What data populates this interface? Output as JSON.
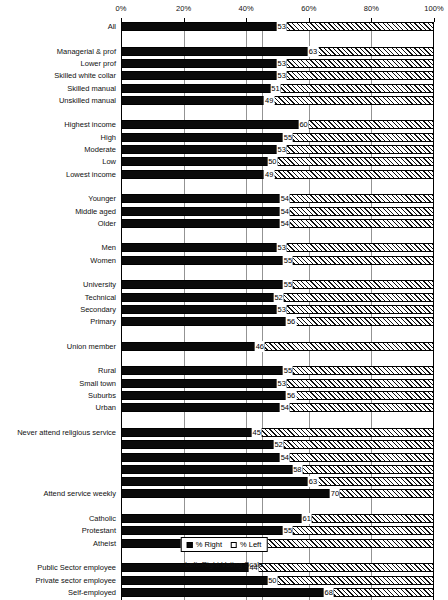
{
  "chart_data": {
    "type": "bar",
    "orientation": "horizontal",
    "title": "",
    "xlabel": "Left–Right Voting Scale",
    "ylabel": "",
    "xlim": [
      0,
      100
    ],
    "xticks": [
      0,
      20,
      40,
      60,
      80,
      100
    ],
    "xticklabels": [
      "0%",
      "20%",
      "40%",
      "60%",
      "80%",
      "100%"
    ],
    "gridlines": [
      20,
      40,
      45,
      60,
      80
    ],
    "grid": true,
    "legend_position": "bottom",
    "series": [
      {
        "name": "% Right",
        "key": "right",
        "color": "#0a0a0a",
        "style": "solid"
      },
      {
        "name": "% Left",
        "key": "left",
        "color": "#ffffff",
        "style": "hatched"
      }
    ],
    "stacked": true,
    "value_suffix": "",
    "groups": [
      {
        "name": "overall",
        "rows": [
          {
            "label": "All",
            "value": 53,
            "show_label": true,
            "show_value": true
          }
        ]
      },
      {
        "name": "occupation",
        "rows": [
          {
            "label": "Managerial & prof",
            "value": 63,
            "show_label": true,
            "show_value": true
          },
          {
            "label": "Lower prof",
            "value": 53,
            "show_label": true,
            "show_value": true
          },
          {
            "label": "Skilled white collar",
            "value": 53,
            "show_label": true,
            "show_value": true
          },
          {
            "label": "Skilled manual",
            "value": 51,
            "show_label": true,
            "show_value": true
          },
          {
            "label": "Unskilled manual",
            "value": 49,
            "show_label": true,
            "show_value": true
          }
        ]
      },
      {
        "name": "income",
        "rows": [
          {
            "label": "Highest income",
            "value": 60,
            "show_label": true,
            "show_value": true
          },
          {
            "label": "High",
            "value": 55,
            "show_label": true,
            "show_value": true
          },
          {
            "label": "Moderate",
            "value": 53,
            "show_label": true,
            "show_value": true
          },
          {
            "label": "Low",
            "value": 50,
            "show_label": true,
            "show_value": true
          },
          {
            "label": "Lowest income",
            "value": 49,
            "show_label": true,
            "show_value": true
          }
        ]
      },
      {
        "name": "age",
        "rows": [
          {
            "label": "Younger",
            "value": 54,
            "show_label": true,
            "show_value": true
          },
          {
            "label": "Middle aged",
            "value": 54,
            "show_label": true,
            "show_value": true
          },
          {
            "label": "Older",
            "value": 54,
            "show_label": true,
            "show_value": true
          }
        ]
      },
      {
        "name": "gender",
        "rows": [
          {
            "label": "Men",
            "value": 53,
            "show_label": true,
            "show_value": true
          },
          {
            "label": "Women",
            "value": 55,
            "show_label": true,
            "show_value": true
          }
        ]
      },
      {
        "name": "education",
        "rows": [
          {
            "label": "University",
            "value": 55,
            "show_label": true,
            "show_value": true
          },
          {
            "label": "Technical",
            "value": 52,
            "show_label": true,
            "show_value": true
          },
          {
            "label": "Secondary",
            "value": 53,
            "show_label": true,
            "show_value": true
          },
          {
            "label": "Primary",
            "value": 56,
            "show_label": true,
            "show_value": true
          }
        ]
      },
      {
        "name": "union",
        "rows": [
          {
            "label": "Union member",
            "value": 46,
            "show_label": true,
            "show_value": true
          }
        ]
      },
      {
        "name": "settlement",
        "rows": [
          {
            "label": "Rural",
            "value": 55,
            "show_label": true,
            "show_value": true
          },
          {
            "label": "Small town",
            "value": 53,
            "show_label": true,
            "show_value": true
          },
          {
            "label": "Suburbs",
            "value": 56,
            "show_label": true,
            "show_value": true
          },
          {
            "label": "Urban",
            "value": 54,
            "show_label": true,
            "show_value": true
          }
        ]
      },
      {
        "name": "religious-attendance",
        "rows": [
          {
            "label": "Never attend religious service",
            "value": 45,
            "show_label": true,
            "show_value": true
          },
          {
            "label": "",
            "value": 52,
            "show_label": false,
            "show_value": true
          },
          {
            "label": "",
            "value": 54,
            "show_label": false,
            "show_value": true
          },
          {
            "label": "",
            "value": 58,
            "show_label": false,
            "show_value": true
          },
          {
            "label": "",
            "value": 63,
            "show_label": false,
            "show_value": true
          },
          {
            "label": "Attend service weekly",
            "value": 70,
            "show_label": true,
            "show_value": true
          }
        ]
      },
      {
        "name": "denomination",
        "rows": [
          {
            "label": "Catholic",
            "value": 61,
            "show_label": true,
            "show_value": true
          },
          {
            "label": "Protestant",
            "value": 55,
            "show_label": true,
            "show_value": true
          },
          {
            "label": "Atheist",
            "value": 43,
            "show_label": true,
            "show_value": true
          }
        ]
      },
      {
        "name": "employment-sector",
        "rows": [
          {
            "label": "Public Sector employee",
            "value": 44,
            "show_label": true,
            "show_value": true
          },
          {
            "label": "Private sector employee",
            "value": 50,
            "show_label": true,
            "show_value": true
          },
          {
            "label": "Self-employed",
            "value": 68,
            "show_label": true,
            "show_value": true
          }
        ]
      }
    ]
  },
  "legend": {
    "right_label": "% Right",
    "left_label": "% Left"
  },
  "axis": {
    "title": "Left–Right Voting Scale"
  }
}
